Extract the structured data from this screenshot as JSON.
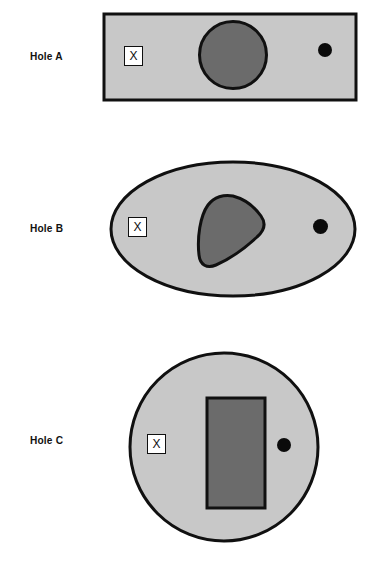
{
  "figure": {
    "background_color": "#ffffff",
    "outline_color": "#101010",
    "body_fill_color": "#c8c8c8",
    "inclusion_fill_color": "#6b6b6b",
    "marker_fill_color": "#ffffff",
    "dot_color": "#0b0b0b"
  },
  "panels": [
    {
      "id": "a",
      "label": "Hole A",
      "body_shape": "rectangle",
      "inclusion_shape": "circle",
      "marker_glyph": "X"
    },
    {
      "id": "b",
      "label": "Hole B",
      "body_shape": "ellipse",
      "inclusion_shape": "rounded-triangle-blob",
      "marker_glyph": "X"
    },
    {
      "id": "c",
      "label": "Hole C",
      "body_shape": "circle",
      "inclusion_shape": "rectangle",
      "marker_glyph": "X"
    }
  ]
}
